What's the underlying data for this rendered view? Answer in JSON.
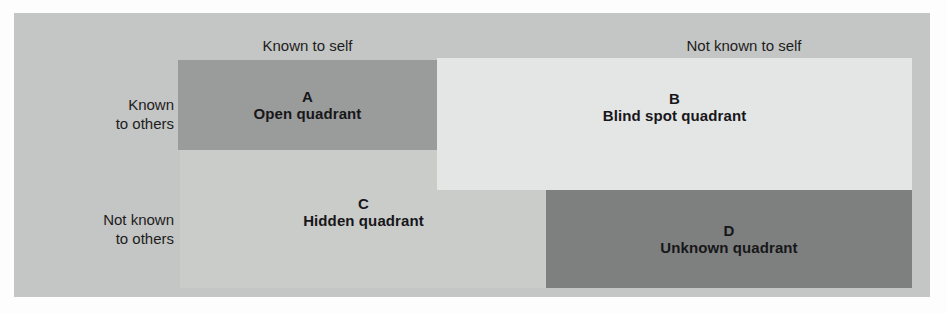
{
  "figure": {
    "name": "Johari Window",
    "colors": {
      "page_background": "#fdfdfd",
      "panel_background": "#c4c5c5",
      "quadrant_a": "#9a9b9b",
      "quadrant_b": "#e4e5e5",
      "quadrant_c": "#caccca",
      "quadrant_d": "#7e7f7f",
      "text": "#17171a"
    }
  },
  "column_headers": [
    {
      "label": "Known to self"
    },
    {
      "label": "Not known to self"
    }
  ],
  "row_labels": [
    {
      "line1": "Known",
      "line2": "to others"
    },
    {
      "line1": "Not known",
      "line2": "to others"
    }
  ],
  "quadrants": [
    {
      "letter": "A",
      "title": "Open quadrant",
      "row": "Known to others",
      "column": "Known to self",
      "fill": "#9a9b9b"
    },
    {
      "letter": "B",
      "title": "Blind spot quadrant",
      "row": "Known to others",
      "column": "Not known to self",
      "fill": "#e4e5e5"
    },
    {
      "letter": "C",
      "title": "Hidden quadrant",
      "row": "Not known to others",
      "column": "Known to self",
      "fill": "#caccca"
    },
    {
      "letter": "D",
      "title": "Unknown quadrant",
      "row": "Not known to others",
      "column": "Not known to self",
      "fill": "#7e7f7f"
    }
  ]
}
